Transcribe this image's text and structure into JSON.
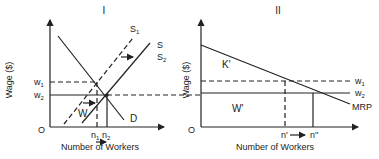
{
  "panels": [
    {
      "title": "I",
      "ylabel": "Wage ($)",
      "xlabel": "Number of Workers",
      "origin_label": "O",
      "y_ticks": [
        "w1",
        "w2"
      ],
      "x_ticks": [
        "n1",
        "n2"
      ],
      "curves": [
        {
          "label": "D",
          "style": "solid"
        },
        {
          "label": "S1",
          "style": "dashed"
        },
        {
          "label": "S",
          "style": "solid"
        },
        {
          "label": "S2",
          "style": "solid"
        }
      ],
      "region_labels": [
        "W"
      ]
    },
    {
      "title": "II",
      "ylabel": "Wage ($)",
      "xlabel": "Number of Workers",
      "origin_label": "O",
      "y_ticks": [
        "w1",
        "w2"
      ],
      "x_ticks": [
        "n'",
        "n''"
      ],
      "curves": [
        {
          "label": "MRP",
          "style": "solid"
        }
      ],
      "region_labels": [
        "K'",
        "W'"
      ]
    }
  ],
  "labels": {
    "p1_title": "I",
    "p2_title": "II",
    "ylabel": "Wage ($)",
    "xlabel": "Number of Workers",
    "origin": "O",
    "w1": "w",
    "w1_sub": "1",
    "w2": "w",
    "w2_sub": "2",
    "n1": "n",
    "n1_sub": "1",
    "n2": "n",
    "n2_sub": "2",
    "S1": "S",
    "S1_sub": "1",
    "S": "S",
    "S2": "S",
    "S2_sub": "2",
    "D": "D",
    "W": "W",
    "K_prime": "K'",
    "W_prime": "W'",
    "MRP": "MRP",
    "n_prime": "n'",
    "n_dprime": "n''"
  }
}
